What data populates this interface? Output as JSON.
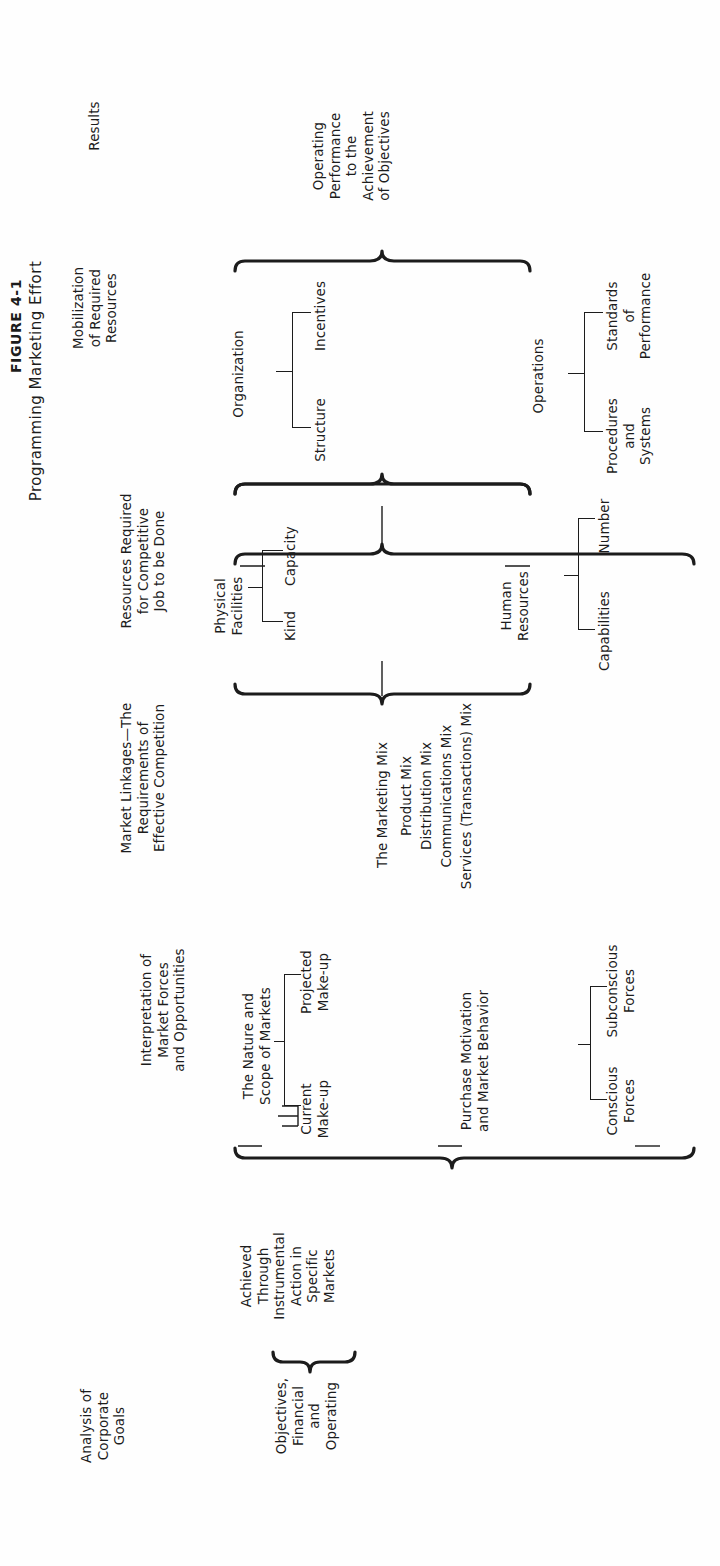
{
  "figure": {
    "label": "FIGURE 4-1",
    "title": "Programming Marketing Effort"
  },
  "columns": {
    "goals": "Analysis of\nCorporate\nGoals",
    "interpretation": "Interpretation of\nMarket Forces\nand Opportunities",
    "linkages": "Market Linkages—The\nRequirements of\nEffective Competition",
    "resources_required": "Resources Required\nfor Competitive\nJob to be Done",
    "mobilization": "Mobilization\nof Required\nResources",
    "results": "Results"
  },
  "goals": {
    "objectives": "Objectives,\nFinancial\nand\nOperating",
    "achieved": "Achieved\nThrough\nInstrumental\nAction in\nSpecific\nMarkets"
  },
  "markets": {
    "nature_scope": "The Nature and\nScope of Markets",
    "current": "Current\nMake-up",
    "projected": "Projected\nMake-up",
    "purchase_motivation": "Purchase Motivation\nand Market Behavior",
    "conscious": "Conscious\nForces",
    "subconscious": "Subconscious\nForces"
  },
  "marketing_mix": {
    "title": "The Marketing Mix",
    "items": [
      "Product Mix",
      "Distribution Mix",
      "Communications Mix",
      "Services (Transactions) Mix"
    ]
  },
  "resources": {
    "physical_facilities": "Physical\nFacilities",
    "kind": "Kind",
    "capacity": "Capacity",
    "human_resources": "Human\nResources",
    "capabilities": "Capabilities",
    "number": "Number"
  },
  "mobilization": {
    "organization": "Organization",
    "structure": "Structure",
    "incentives": "Incentives",
    "operations": "Operations",
    "procedures": "Procedures\nand\nSystems",
    "standards": "Standards\nof\nPerformance"
  },
  "results": {
    "operating_performance": "Operating\nPerformance\nto the\nAchievement\nof Objectives"
  },
  "colors": {
    "ink": "#1c1c1c",
    "paper": "#fefefe"
  }
}
